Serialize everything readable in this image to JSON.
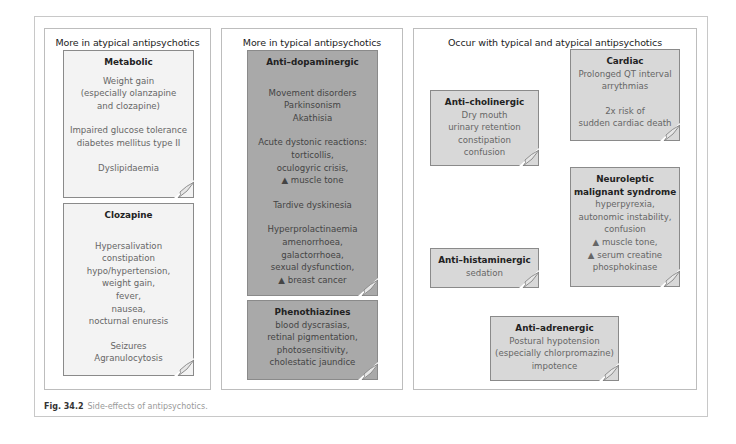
{
  "figure": {
    "caption_label": "Fig. 34.2",
    "caption_text": "Side-effects of antipsychotics."
  },
  "panels": {
    "atypical": {
      "title": "More in atypical antipsychotics",
      "cards": {
        "metabolic": {
          "title": "Metabolic",
          "lines": [
            "Weight gain",
            "(especially olanzapine",
            "and clozapine)",
            "",
            "Impaired glucose tolerance",
            "diabetes mellitus type II",
            "",
            "Dyslipidaemia"
          ]
        },
        "clozapine": {
          "title": "Clozapine",
          "lines": [
            "",
            "Hypersalivation",
            "constipation",
            "hypo/hypertension,",
            "weight gain,",
            "fever,",
            "nausea,",
            "nocturnal enuresis",
            "",
            "Seizures",
            "Agranulocytosis"
          ]
        }
      }
    },
    "typical": {
      "title": "More in typical antipsychotics",
      "cards": {
        "antidopaminergic": {
          "title": "Anti–dopaminergic",
          "lines": [
            "",
            "Movement disorders",
            "Parkinsonism",
            "Akathisia",
            "",
            "Acute dystonic reactions:",
            "torticollis,",
            "oculogyric crisis,",
            "▲ muscle tone",
            "",
            "Tardive dyskinesia",
            "",
            "Hyperprolactinaemia",
            "amenorrhoea,",
            "galactorrhoea,",
            "sexual dysfunction,",
            "▲ breast cancer"
          ]
        },
        "phenothiazines": {
          "title": "Phenothiazines",
          "lines": [
            "blood dyscrasias,",
            "retinal pigmentation,",
            "photosensitivity,",
            "cholestatic jaundice"
          ]
        }
      }
    },
    "both": {
      "title": "Occur with typical and atypical antipsychotics",
      "cards": {
        "cardiac": {
          "title": "Cardiac",
          "lines": [
            "Prolonged QT interval",
            "arrythmias",
            "",
            "2x risk of",
            "sudden cardiac death"
          ]
        },
        "anticholinergic": {
          "title": "Anti–cholinergic",
          "lines": [
            "Dry mouth",
            "urinary retention",
            "constipation",
            "confusion"
          ]
        },
        "nms": {
          "title": "Neuroleptic malignant syndrome",
          "lines": [
            "hyperpyrexia,",
            "autonomic instability,",
            "confusion",
            "▲ muscle tone,",
            "▲ serum creatine",
            "phosphokinase"
          ]
        },
        "antihistaminergic": {
          "title": "Anti–histaminergic",
          "lines": [
            "sedation"
          ]
        },
        "antiadrenergic": {
          "title": "Anti–adrenergic",
          "lines": [
            "Postural hypotension",
            "(especially chlorpromazine)",
            "impotence"
          ]
        }
      }
    }
  },
  "colors": {
    "light_card": "#f3f3f3",
    "mid_card": "#d8d8d8",
    "dark_card": "#a9a9a9"
  }
}
